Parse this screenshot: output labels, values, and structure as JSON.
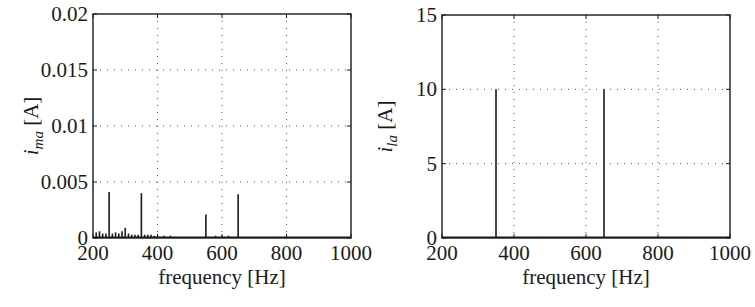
{
  "chart_data": [
    {
      "id": "left",
      "type": "bar",
      "subtype": "stem-spectrum",
      "title": "",
      "xlabel": "frequency [Hz]",
      "ylabel": {
        "var": "i",
        "sub": "ma",
        "unit": " [A]"
      },
      "xlim": [
        200,
        1000
      ],
      "ylim": [
        0,
        0.02
      ],
      "xticks": [
        200,
        400,
        600,
        800,
        1000
      ],
      "xtick_labels": [
        "200",
        "400",
        "600",
        "800",
        "1000"
      ],
      "yticks": [
        0,
        0.005,
        0.01,
        0.015,
        0.02
      ],
      "ytick_labels": [
        "0",
        "0.005",
        "0.01",
        "0.015",
        "0.02"
      ],
      "grid": true,
      "x": [
        210,
        220,
        230,
        240,
        250,
        260,
        270,
        280,
        290,
        300,
        310,
        320,
        330,
        340,
        350,
        360,
        370,
        380,
        390,
        400,
        420,
        440,
        460,
        480,
        500,
        520,
        540,
        550,
        560,
        580,
        600,
        620,
        640,
        650,
        660,
        680,
        700,
        750,
        800,
        850,
        900,
        950
      ],
      "values": [
        0.0005,
        0.0006,
        0.0004,
        0.0004,
        0.0041,
        0.0004,
        0.0005,
        0.0004,
        0.0006,
        0.0009,
        0.0004,
        0.0003,
        0.0003,
        0.0003,
        0.004,
        0.0003,
        0.0003,
        0.0003,
        0.0002,
        0.0002,
        0.0002,
        0.0002,
        0.0001,
        0.0001,
        0.0001,
        0.0001,
        0.0001,
        0.0021,
        0.0001,
        0.0002,
        0.0002,
        0.0002,
        0.0001,
        0.0039,
        0.0001,
        0.0001,
        0.0001,
        0.0001,
        0.0001,
        0.0001,
        0.0001,
        0.0001
      ]
    },
    {
      "id": "right",
      "type": "bar",
      "subtype": "stem-spectrum",
      "title": "",
      "xlabel": "frequency [Hz]",
      "ylabel": {
        "var": "i",
        "sub": "la",
        "unit": " [A]"
      },
      "xlim": [
        200,
        1000
      ],
      "ylim": [
        0,
        15
      ],
      "xticks": [
        200,
        400,
        600,
        800,
        1000
      ],
      "xtick_labels": [
        "200",
        "400",
        "600",
        "800",
        "1000"
      ],
      "yticks": [
        0,
        5,
        10,
        15
      ],
      "ytick_labels": [
        "0",
        "5",
        "10",
        "15"
      ],
      "grid": true,
      "x": [
        350,
        650
      ],
      "values": [
        10,
        10
      ]
    }
  ],
  "colors": {
    "line": "#1a1a1a",
    "grid": "#555555",
    "background": "#ffffff"
  }
}
